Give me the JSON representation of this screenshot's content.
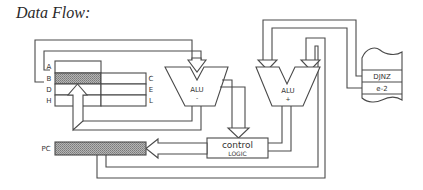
{
  "title": "Data Flow:",
  "registers": {
    "left_labels": [
      "A",
      "B",
      "D",
      "H"
    ],
    "right_labels": [
      "C",
      "E",
      "L"
    ],
    "highlighted": "B"
  },
  "alu_left": {
    "label": "ALU",
    "op": "-"
  },
  "alu_right": {
    "label": "ALU",
    "op": "+"
  },
  "memory": {
    "rows": [
      "DJNZ",
      "e-2"
    ]
  },
  "control": {
    "line1": "control",
    "line2": "LOGIC"
  },
  "pc": {
    "label": "PC"
  },
  "colors": {
    "line": "#4a4a4a",
    "hatch": "#9a9a9a",
    "background": "#ffffff"
  }
}
